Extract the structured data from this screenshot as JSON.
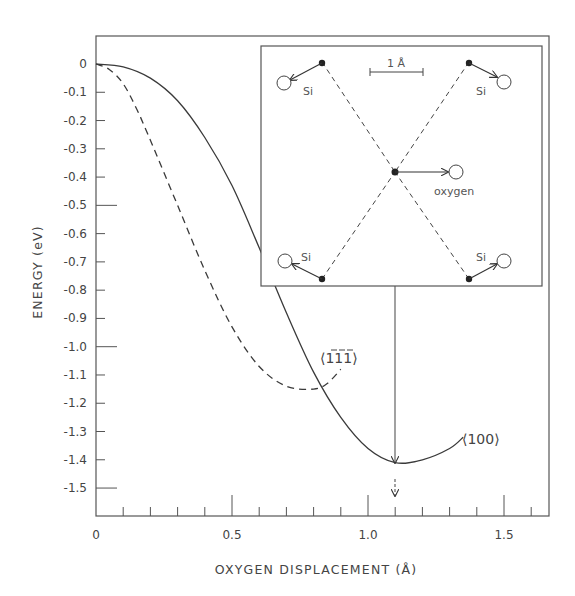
{
  "chart_data": {
    "type": "line",
    "title": "",
    "xlabel": "OXYGEN DISPLACEMENT (Å)",
    "ylabel": "ENERGY (eV)",
    "xlim": [
      0,
      1.65
    ],
    "ylim": [
      -1.6,
      0.08
    ],
    "x_ticks": [
      0,
      0.5,
      1.0,
      1.5
    ],
    "x_tick_labels": [
      "0",
      "0.5",
      "1.0",
      "1.5"
    ],
    "x_minor_step": 0.1,
    "y_ticks": [
      0,
      -0.1,
      -0.2,
      -0.3,
      -0.4,
      -0.5,
      -0.6,
      -0.7,
      -0.8,
      -0.9,
      -1.0,
      -1.1,
      -1.2,
      -1.3,
      -1.4,
      -1.5
    ],
    "y_tick_labels": [
      "0",
      "-0.1",
      "-0.2",
      "-0.3",
      "-0.4",
      "-0.5",
      "-0.6",
      "-0.7",
      "-0.8",
      "-0.9",
      "-1.0",
      "-1.1",
      "-1.2",
      "-1.3",
      "-1.4",
      "-1.5"
    ],
    "grid": false,
    "series": [
      {
        "name": "⟨100⟩",
        "style": "solid",
        "x": [
          0,
          0.1,
          0.2,
          0.3,
          0.4,
          0.5,
          0.6,
          0.7,
          0.8,
          0.9,
          1.0,
          1.1,
          1.2,
          1.3,
          1.35
        ],
        "y": [
          0,
          -0.01,
          -0.05,
          -0.13,
          -0.26,
          -0.43,
          -0.65,
          -0.88,
          -1.09,
          -1.25,
          -1.36,
          -1.41,
          -1.4,
          -1.36,
          -1.32
        ]
      },
      {
        "name": "⟨1̄1̄1̄⟩",
        "style": "dashed",
        "x": [
          0,
          0.05,
          0.1,
          0.15,
          0.2,
          0.3,
          0.4,
          0.5,
          0.6,
          0.7,
          0.8,
          0.85,
          0.9
        ],
        "y": [
          0,
          -0.02,
          -0.07,
          -0.16,
          -0.27,
          -0.5,
          -0.73,
          -0.93,
          -1.07,
          -1.14,
          -1.15,
          -1.13,
          -1.08
        ]
      }
    ],
    "annotations": [
      {
        "text": "⟨100⟩",
        "near_series": "solid"
      },
      {
        "text": "⟨1̄1̄1̄⟩",
        "near_series": "dashed"
      },
      {
        "type": "arrow",
        "x": 1.1,
        "description": "vertical arrow from inset down to solid-curve minimum at 1.1 Å"
      },
      {
        "type": "arrow",
        "x": 1.1,
        "description": "small downward arrow above x-axis marking 1.1 Å"
      }
    ],
    "inset": {
      "description": "Atomic displacement diagram: four Si atoms at corners connected by dashed lines crossing at a central oxygen; arrows show Si displacements outward and oxygen displacement to the right",
      "scale_bar_label": "1 Å",
      "atoms": [
        {
          "label": "Si",
          "position": "top-left"
        },
        {
          "label": "Si",
          "position": "top-right"
        },
        {
          "label": "Si",
          "position": "bottom-left"
        },
        {
          "label": "Si",
          "position": "bottom-right"
        },
        {
          "label": "oxygen",
          "position": "center"
        }
      ]
    }
  },
  "labels": {
    "ylabel": "ENERGY  (eV)",
    "xlabel": "OXYGEN  DISPLACEMENT  (Å)",
    "curve_100": "⟨100⟩",
    "curve_111": "⟨111⟩",
    "scale_bar": "1 Å",
    "si": "Si",
    "oxygen": "oxygen"
  },
  "colors": {
    "ink": "#3a3a3a",
    "light_ink": "#555555"
  }
}
